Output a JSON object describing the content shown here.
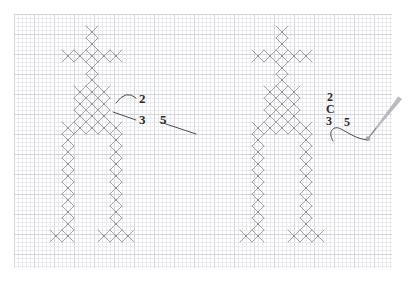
{
  "page": {
    "background_color": "#ffffff",
    "width": 409,
    "height": 284
  },
  "grid": {
    "name": "graph-paper-grid",
    "origin_x": 14,
    "origin_y": 14,
    "right": 392,
    "bottom": 268,
    "minor_spacing": 4,
    "major_every": 5,
    "minor_color": "#e9eaee",
    "major_color": "#d2d4da"
  },
  "stitch": {
    "cell": 12,
    "color": "#9a9aa0",
    "hole_color": "#6f6f76",
    "line_width": 0.9
  },
  "figures": [
    {
      "name": "cross-stitch-figure-left",
      "origin_x": 50,
      "origin_y": 26,
      "cells": [
        [
          3,
          0
        ],
        [
          3,
          1
        ],
        [
          1,
          2
        ],
        [
          2,
          2
        ],
        [
          3,
          2
        ],
        [
          4,
          2
        ],
        [
          5,
          2
        ],
        [
          3,
          3
        ],
        [
          3,
          4
        ],
        [
          2,
          5
        ],
        [
          3,
          5
        ],
        [
          4,
          5
        ],
        [
          2,
          6
        ],
        [
          3,
          6
        ],
        [
          4,
          6
        ],
        [
          2,
          7
        ],
        [
          3,
          7
        ],
        [
          4,
          7
        ],
        [
          1,
          8
        ],
        [
          2,
          8
        ],
        [
          3,
          8
        ],
        [
          4,
          8
        ],
        [
          5,
          8
        ],
        [
          1,
          9
        ],
        [
          5,
          9
        ],
        [
          1,
          10
        ],
        [
          5,
          10
        ],
        [
          1,
          11
        ],
        [
          5,
          11
        ],
        [
          1,
          12
        ],
        [
          5,
          12
        ],
        [
          1,
          13
        ],
        [
          5,
          13
        ],
        [
          1,
          14
        ],
        [
          5,
          14
        ],
        [
          1,
          15
        ],
        [
          5,
          15
        ],
        [
          1,
          16
        ],
        [
          5,
          16
        ],
        [
          0,
          17
        ],
        [
          1,
          17
        ],
        [
          4,
          17
        ],
        [
          5,
          17
        ],
        [
          6,
          17
        ]
      ]
    },
    {
      "name": "cross-stitch-figure-right",
      "origin_x": 240,
      "origin_y": 26,
      "cells": [
        [
          3,
          0
        ],
        [
          3,
          1
        ],
        [
          1,
          2
        ],
        [
          2,
          2
        ],
        [
          3,
          2
        ],
        [
          4,
          2
        ],
        [
          5,
          2
        ],
        [
          3,
          3
        ],
        [
          3,
          4
        ],
        [
          2,
          5
        ],
        [
          3,
          5
        ],
        [
          4,
          5
        ],
        [
          2,
          6
        ],
        [
          3,
          6
        ],
        [
          4,
          6
        ],
        [
          2,
          7
        ],
        [
          3,
          7
        ],
        [
          4,
          7
        ],
        [
          1,
          8
        ],
        [
          2,
          8
        ],
        [
          3,
          8
        ],
        [
          4,
          8
        ],
        [
          5,
          8
        ],
        [
          1,
          9
        ],
        [
          5,
          9
        ],
        [
          1,
          10
        ],
        [
          5,
          10
        ],
        [
          1,
          11
        ],
        [
          5,
          11
        ],
        [
          1,
          12
        ],
        [
          5,
          12
        ],
        [
          1,
          13
        ],
        [
          5,
          13
        ],
        [
          1,
          14
        ],
        [
          5,
          14
        ],
        [
          1,
          15
        ],
        [
          5,
          15
        ],
        [
          1,
          16
        ],
        [
          5,
          16
        ],
        [
          0,
          17
        ],
        [
          1,
          17
        ],
        [
          4,
          17
        ],
        [
          5,
          17
        ],
        [
          6,
          17
        ]
      ]
    }
  ],
  "annotations_left": {
    "name": "left-annotation-group",
    "labels": [
      {
        "name": "label-2-left",
        "text": "2",
        "x": 139,
        "y": 92
      },
      {
        "name": "label-3-left",
        "text": "3",
        "x": 139,
        "y": 113
      },
      {
        "name": "label-5-left",
        "text": "5",
        "x": 160,
        "y": 113
      }
    ],
    "leaders": [
      {
        "name": "leader-2-left",
        "from_x": 136,
        "from_y": 98,
        "to_x": 116,
        "to_y": 103,
        "curve": true
      },
      {
        "name": "leader-3-left",
        "from_x": 136,
        "from_y": 120,
        "to_x": 113,
        "to_y": 112,
        "curve": false
      },
      {
        "name": "leader-5-left",
        "from_x": 160,
        "from_y": 122,
        "to_x": 196,
        "to_y": 134,
        "curve": false
      }
    ]
  },
  "annotations_right": {
    "name": "right-annotation-group",
    "labels": [
      {
        "name": "label-2-right",
        "text": "2",
        "x": 327,
        "y": 91
      },
      {
        "name": "label-C-right",
        "text": "C",
        "x": 326,
        "y": 103
      },
      {
        "name": "label-3-right",
        "text": "3",
        "x": 326,
        "y": 115
      },
      {
        "name": "label-5-right",
        "text": "5",
        "x": 344,
        "y": 116
      }
    ],
    "thread": {
      "name": "thread-curve",
      "path": "M 333 141 C 327 131 334 125 341 129 C 349 133 356 139 368 140"
    }
  },
  "needle": {
    "name": "sewing-needle",
    "tip_x": 366,
    "tip_y": 141,
    "end_x": 400,
    "end_y": 98,
    "width": 4,
    "color": "#b9bac0",
    "eye_color": "#8b8c92"
  }
}
